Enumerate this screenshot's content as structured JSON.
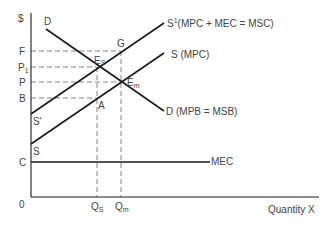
{
  "axes": {
    "y_label": "$",
    "x_label": "Quantity X",
    "origin_label": "0"
  },
  "y_ticks": {
    "F": "F",
    "P1_main": "P",
    "P1_sub": "1",
    "P": "P",
    "B": "B",
    "C": "C"
  },
  "x_ticks": {
    "Qs_main": "Q",
    "Qs_sub": "S",
    "Qm_main": "Q",
    "Qm_sub": "m"
  },
  "curves": {
    "demand_start_label": "D",
    "demand_label": "D (MPB = MSB)",
    "social_supply_main": "S",
    "social_supply_sup": "1",
    "social_supply_text": "(MPC + MEC = MSC)",
    "private_supply_label": "S (MPC)",
    "social_supply_start_label": "S'",
    "private_supply_start_label": "S",
    "mec_label": "MEC"
  },
  "points": {
    "G": "G",
    "Es_main": "E",
    "Es_sub": "S",
    "Em_main": "E",
    "Em_sub": "m",
    "A": "A"
  },
  "colors": {
    "line": "#1a1a1a",
    "dash": "#777777",
    "text": "#444444"
  }
}
